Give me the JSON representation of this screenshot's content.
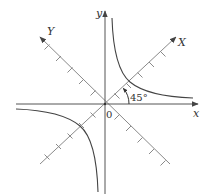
{
  "diagram": {
    "type": "rotated-axes-hyperbola",
    "axes": {
      "x_label": "x",
      "y_label": "y",
      "X_label": "X",
      "Y_label": "Y",
      "origin_label": "0"
    },
    "angle": {
      "label": "45°",
      "degrees": 45
    },
    "ticks_per_half_diagonal": 5,
    "colors": {
      "axis": "#555555",
      "rotated_axis": "#8a8a8a",
      "curve": "#444444",
      "text": "#333333",
      "background": "#ffffff"
    }
  }
}
